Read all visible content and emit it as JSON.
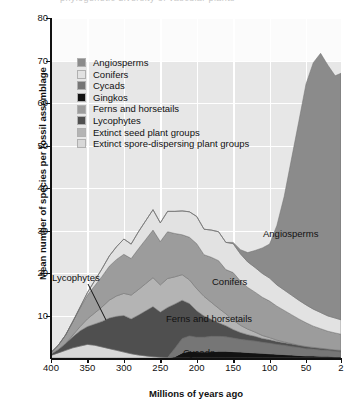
{
  "figure": {
    "cropped_header_remnant": "phylogenetic diversity of vascular plants",
    "background": "#ffffff",
    "panel_background": "#e7e7e7",
    "panel_upper_background": "#fbfbfb",
    "gridline_color": "#ffffff",
    "axis_color": "#111111"
  },
  "legend": {
    "position": "inside-top-left",
    "entries": [
      {
        "label": "Angiosperms",
        "color": "#8b8b8b"
      },
      {
        "label": "Conifers",
        "color": "#e2e2e2"
      },
      {
        "label": "Cycads",
        "color": "#767676"
      },
      {
        "label": "Gingkos",
        "color": "#121212"
      },
      {
        "label": "Ferns and horsetails",
        "color": "#9c9c9c"
      },
      {
        "label": "Lycophytes",
        "color": "#4f4f4f"
      },
      {
        "label": "Extinct seed plant groups",
        "color": "#b4b4b4"
      },
      {
        "label": "Extinct spore-dispersing plant groups",
        "color": "#d8d8d8"
      }
    ]
  },
  "annotations": [
    {
      "name": "label-angiosperms",
      "text": "Angiosperms",
      "x": 263,
      "y": 228
    },
    {
      "name": "label-conifers",
      "text": "Conifers",
      "x": 212,
      "y": 276
    },
    {
      "name": "label-ferns-horsetails",
      "text": "Ferns and horsetails",
      "x": 166,
      "y": 313
    },
    {
      "name": "label-cycads",
      "text": "Cycads",
      "x": 183,
      "y": 347
    },
    {
      "name": "label-lycophytes",
      "text": "Lycophytes",
      "x": 52,
      "y": 272,
      "leader_from": [
        88,
        284
      ],
      "leader_to": [
        106,
        320
      ]
    }
  ],
  "chart_data": {
    "type": "area",
    "stacked": true,
    "title": "",
    "xlabel": "Millions of years ago",
    "ylabel": "Mean number of species per fossil assemblage",
    "xlim": [
      400,
      2
    ],
    "x_reversed": true,
    "ylim": [
      0,
      80
    ],
    "yticks": [
      10,
      20,
      30,
      40,
      50,
      60,
      70,
      80
    ],
    "xticks": [
      400,
      350,
      300,
      250,
      200,
      150,
      100,
      50,
      2
    ],
    "grid": true,
    "x": [
      400,
      390,
      380,
      370,
      360,
      350,
      340,
      330,
      320,
      310,
      300,
      290,
      280,
      270,
      260,
      250,
      240,
      230,
      220,
      210,
      200,
      190,
      180,
      170,
      160,
      150,
      140,
      130,
      120,
      110,
      100,
      90,
      80,
      70,
      60,
      50,
      40,
      30,
      20,
      10,
      2
    ],
    "stack_order_bottom_to_top": [
      "Gingkos",
      "Cycads",
      "Extinct spore-dispersing plant groups",
      "Lycophytes",
      "Extinct seed plant groups",
      "Ferns and horsetails",
      "Conifers",
      "Angiosperms"
    ],
    "series": [
      {
        "name": "Gingkos",
        "color": "#121212",
        "values": [
          0,
          0,
          0,
          0,
          0,
          0,
          0,
          0,
          0,
          0,
          0,
          0,
          0,
          0,
          0,
          0,
          0,
          0.3,
          1.2,
          1.6,
          1.5,
          1.4,
          1.5,
          1.6,
          1.6,
          1.5,
          1.4,
          1.3,
          1.2,
          1.1,
          1.0,
          0.9,
          0.8,
          0.7,
          0.6,
          0.5,
          0.5,
          0.4,
          0.4,
          0.3,
          0.3
        ]
      },
      {
        "name": "Cycads",
        "color": "#767676",
        "values": [
          0,
          0,
          0,
          0,
          0,
          0,
          0,
          0,
          0,
          0,
          0,
          0,
          0,
          0,
          0,
          0,
          0,
          2.0,
          3.4,
          3.6,
          3.4,
          3.5,
          3.6,
          3.5,
          3.4,
          3.2,
          3.0,
          2.9,
          2.8,
          2.6,
          2.5,
          2.3,
          2.2,
          2.0,
          1.9,
          1.7,
          1.6,
          1.5,
          1.4,
          1.3,
          1.2
        ]
      },
      {
        "name": "Extinct spore-dispersing plant groups",
        "color": "#d8d8d8",
        "values": [
          0.6,
          1.2,
          1.8,
          2.4,
          2.8,
          3.2,
          3.0,
          2.6,
          2.2,
          1.8,
          1.4,
          1.0,
          0.7,
          0.5,
          0.3,
          0.2,
          0.1,
          0,
          0,
          0,
          0,
          0,
          0,
          0,
          0,
          0,
          0,
          0,
          0,
          0,
          0,
          0,
          0,
          0,
          0,
          0,
          0,
          0,
          0,
          0,
          0
        ]
      },
      {
        "name": "Lycophytes",
        "color": "#4f4f4f",
        "values": [
          0.3,
          0.8,
          1.6,
          2.6,
          3.6,
          4.2,
          5.0,
          6.0,
          7.2,
          8.0,
          8.6,
          8.2,
          9.4,
          10.6,
          11.8,
          10.6,
          11.8,
          10.4,
          9.0,
          7.6,
          6.2,
          5.0,
          4.0,
          3.2,
          2.6,
          2.0,
          1.6,
          1.3,
          1.1,
          0.9,
          0.8,
          0.7,
          0.6,
          0.6,
          0.5,
          0.5,
          0.4,
          0.4,
          0.3,
          0.3,
          0.3
        ]
      },
      {
        "name": "Extinct seed plant groups",
        "color": "#b4b4b4",
        "values": [
          0,
          0,
          0,
          0.4,
          1.0,
          1.8,
          2.6,
          3.4,
          4.2,
          4.8,
          5.2,
          5.6,
          6.0,
          6.4,
          6.8,
          6.4,
          6.8,
          6.4,
          6.0,
          5.6,
          5.2,
          4.6,
          4.0,
          3.4,
          2.8,
          2.2,
          1.7,
          1.3,
          1.0,
          0.7,
          0.5,
          0.3,
          0.2,
          0.1,
          0,
          0,
          0,
          0,
          0,
          0,
          0
        ]
      },
      {
        "name": "Ferns and horsetails",
        "color": "#9c9c9c",
        "values": [
          0.4,
          1.0,
          2.0,
          3.2,
          4.4,
          5.6,
          6.4,
          7.2,
          8.0,
          8.6,
          9.2,
          8.6,
          9.6,
          10.4,
          11.2,
          10.2,
          11.0,
          10.2,
          9.4,
          10.0,
          10.6,
          9.8,
          10.6,
          11.2,
          10.4,
          11.2,
          10.4,
          9.8,
          9.4,
          9.0,
          8.6,
          8.0,
          7.4,
          6.8,
          6.2,
          5.6,
          5.0,
          4.6,
          4.2,
          4.0,
          3.8
        ]
      },
      {
        "name": "Conifers",
        "color": "#e2e2e2",
        "values": [
          0,
          0,
          0,
          0,
          0.2,
          0.6,
          1.2,
          1.8,
          2.4,
          3.0,
          3.6,
          3.4,
          4.0,
          4.4,
          4.8,
          4.4,
          4.8,
          5.2,
          5.6,
          6.0,
          6.4,
          6.0,
          6.4,
          6.8,
          6.4,
          6.8,
          6.4,
          6.0,
          5.8,
          5.6,
          5.4,
          5.0,
          4.8,
          4.6,
          4.4,
          4.2,
          4.0,
          3.8,
          3.6,
          3.5,
          3.4
        ]
      },
      {
        "name": "Angiosperms",
        "color": "#8b8b8b",
        "values": [
          0,
          0,
          0,
          0,
          0,
          0,
          0,
          0,
          0,
          0,
          0,
          0,
          0,
          0,
          0,
          0,
          0,
          0,
          0,
          0,
          0,
          0,
          0,
          0,
          0,
          0.3,
          1.0,
          2.2,
          4.0,
          6.0,
          8.0,
          14.0,
          22.0,
          32.0,
          42.0,
          52.0,
          58.0,
          61.0,
          59.0,
          57.0,
          58.0
        ]
      }
    ]
  }
}
